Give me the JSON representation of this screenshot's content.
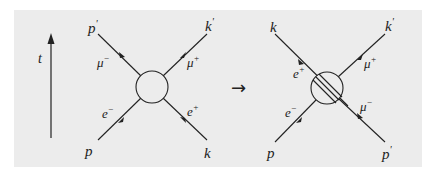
{
  "diagram": {
    "time_axis": {
      "label": "t"
    },
    "arrow_symbol": "→",
    "left": {
      "top_left_momentum": "p",
      "top_left_prime": "'",
      "top_right_momentum": "k",
      "top_right_prime": "'",
      "bottom_left_momentum": "p",
      "bottom_right_momentum": "k",
      "muon_minus": {
        "base": "μ",
        "sup": "−"
      },
      "muon_plus": {
        "base": "μ",
        "sup": "+"
      },
      "electron": {
        "base": "e",
        "sup": "−"
      },
      "positron": {
        "base": "e",
        "sup": "+"
      }
    },
    "right": {
      "top_left_momentum": "k",
      "top_right_momentum": "k",
      "top_right_prime": "'",
      "bottom_left_momentum": "p",
      "bottom_right_momentum": "p",
      "bottom_right_prime": "'",
      "positron": {
        "base": "e",
        "sup": "+"
      },
      "muon_plus": {
        "base": "μ",
        "sup": "+"
      },
      "electron": {
        "base": "e",
        "sup": "−"
      },
      "muon_minus": {
        "base": "μ",
        "sup": "−"
      }
    }
  }
}
